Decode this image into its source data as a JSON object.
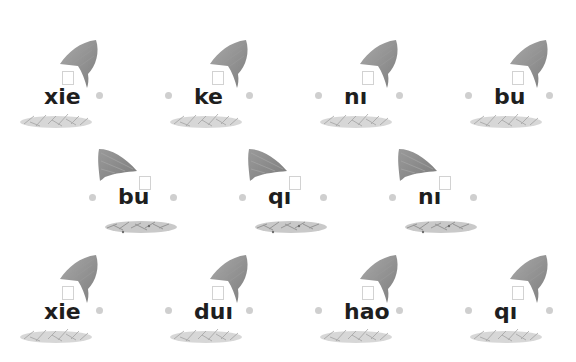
{
  "worksheet": {
    "rows": [
      {
        "layout": "leaf-right",
        "cards": [
          {
            "word": "xie",
            "x": 0,
            "y": 30,
            "left_dot": false
          },
          {
            "word": "ke",
            "x": 150,
            "y": 30,
            "left_dot": true
          },
          {
            "word": "nı",
            "x": 300,
            "y": 30,
            "left_dot": true
          },
          {
            "word": "bu",
            "x": 450,
            "y": 30,
            "left_dot": true
          }
        ]
      },
      {
        "layout": "leaf-left",
        "cards": [
          {
            "word": "bu",
            "x": 75,
            "y": 140,
            "left_dot": true
          },
          {
            "word": "qı",
            "x": 225,
            "y": 140,
            "left_dot": true
          },
          {
            "word": "nı",
            "x": 375,
            "y": 140,
            "left_dot": true
          }
        ]
      },
      {
        "layout": "leaf-right",
        "cards": [
          {
            "word": "xie",
            "x": 0,
            "y": 245,
            "left_dot": false
          },
          {
            "word": "duı",
            "x": 150,
            "y": 245,
            "left_dot": true
          },
          {
            "word": "hao",
            "x": 300,
            "y": 245,
            "left_dot": true
          },
          {
            "word": "qı",
            "x": 450,
            "y": 245,
            "left_dot": true
          }
        ]
      }
    ],
    "icons": {
      "leaf": "leaf-icon",
      "grass": "grass-icon",
      "box": "tone-box",
      "dot": "dot-icon"
    },
    "colors": {
      "text": "#1e1e1e",
      "leaf": "#8c8c8c",
      "dot": "#cfcfcf",
      "grass": "#bdbdbd"
    }
  }
}
